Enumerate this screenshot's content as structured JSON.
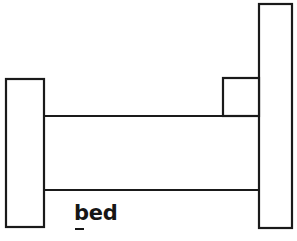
{
  "figure": {
    "title": "bed",
    "caption": "bed",
    "caption_style": "bold",
    "background_color": "#ffffff",
    "stroke_color": "#1a1a1a",
    "fill_color": "#ffffff",
    "stroke_width": 2.2,
    "canvas": {
      "width": 297,
      "height": 241
    },
    "parts": [
      {
        "name": "footboard",
        "shape": "rectangle",
        "x": 6,
        "y": 79,
        "width": 38,
        "height": 148
      },
      {
        "name": "headboard",
        "shape": "rectangle",
        "x": 259,
        "y": 4,
        "width": 33,
        "height": 224
      },
      {
        "name": "pillow-step",
        "shape": "rectangle",
        "x": 223,
        "y": 78,
        "width": 36,
        "height": 38
      },
      {
        "name": "mattress-top-rail",
        "shape": "line",
        "x1": 44,
        "y1": 116,
        "x2": 259,
        "y2": 116
      },
      {
        "name": "mattress-bottom-rail",
        "shape": "line",
        "x1": 44,
        "y1": 190,
        "x2": 259,
        "y2": 190
      }
    ]
  }
}
